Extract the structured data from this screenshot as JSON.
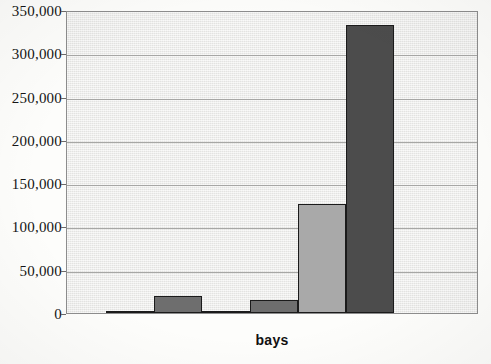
{
  "chart_data": {
    "type": "bar",
    "title": "",
    "xlabel": "bays",
    "ylabel": "",
    "categories": [
      "1",
      "2",
      "3",
      "4",
      "5",
      "6"
    ],
    "values": [
      1000,
      19500,
      1000,
      15000,
      126000,
      333000
    ],
    "bar_colors": [
      "#6e6e6e",
      "#6e6e6e",
      "#6e6e6e",
      "#6e6e6e",
      "#a9a9a9",
      "#4c4c4c"
    ],
    "ylim": [
      0,
      350000
    ],
    "ytick_labels": [
      "0",
      "50,000",
      "100,000",
      "150,000",
      "200,000",
      "250,000",
      "300,000",
      "350,000"
    ],
    "ytick_values": [
      0,
      50000,
      100000,
      150000,
      200000,
      250000,
      300000,
      350000
    ],
    "grid": true,
    "grid_axis": "y",
    "legend": "none",
    "plot_background": "#e9e9e7",
    "axis_color": "#8d8d8d",
    "bar_outline": "#1b1b1b"
  }
}
